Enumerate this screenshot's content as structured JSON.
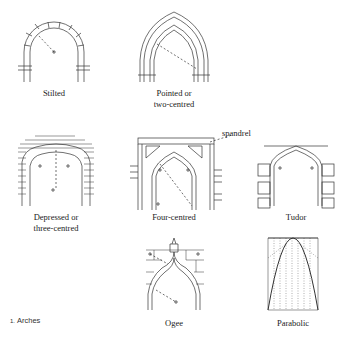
{
  "figure": {
    "number": "1.",
    "caption": "Arches",
    "stroke_color": "#333333",
    "background": "#ffffff"
  },
  "arches": [
    {
      "id": "stilted",
      "label": "Stilted"
    },
    {
      "id": "pointed",
      "label": "Pointed or\ntwo-centred"
    },
    {
      "id": "depressed",
      "label": "Depressed or\nthree-centred"
    },
    {
      "id": "four-centred",
      "label": "Four-centred"
    },
    {
      "id": "tudor",
      "label": "Tudor"
    },
    {
      "id": "ogee",
      "label": "Ogee"
    },
    {
      "id": "parabolic",
      "label": "Parabolic"
    }
  ],
  "annotations": {
    "spandrel": "spandrel"
  }
}
